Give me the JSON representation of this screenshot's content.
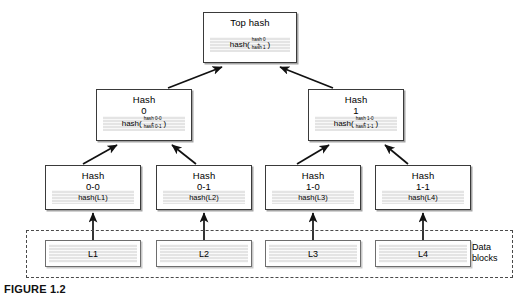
{
  "figure": {
    "caption": "FIGURE 1.2",
    "colors": {
      "box_border": "#3a3a3a",
      "formula_strip": "#e4e4e4",
      "dashed_border": "#4a4a4a",
      "background": "#ffffff",
      "text": "#000000"
    }
  },
  "tree": {
    "root": {
      "title": "Top hash",
      "subtitle": "",
      "formula_prefix": "hash(",
      "formula_arg_top": "hash 0",
      "formula_op": "+",
      "formula_arg_bottom": "hash 1",
      "formula_suffix": ")"
    },
    "mid": [
      {
        "title": "Hash",
        "subtitle": "0",
        "formula_prefix": "hash(",
        "formula_arg_top": "hash 0-0",
        "formula_op": "+",
        "formula_arg_bottom": "hash 0-1",
        "formula_suffix": ")"
      },
      {
        "title": "Hash",
        "subtitle": "1",
        "formula_prefix": "hash(",
        "formula_arg_top": "hash 1-0",
        "formula_op": "+",
        "formula_arg_bottom": "hash 1-1",
        "formula_suffix": ")"
      }
    ],
    "leaves": [
      {
        "title": "Hash",
        "subtitle": "0-0",
        "formula": "hash(L1)"
      },
      {
        "title": "Hash",
        "subtitle": "0-1",
        "formula": "hash(L2)"
      },
      {
        "title": "Hash",
        "subtitle": "1-0",
        "formula": "hash(L3)"
      },
      {
        "title": "Hash",
        "subtitle": "1-1",
        "formula": "hash(L4)"
      }
    ]
  },
  "data_blocks": {
    "group_label": "Data\nblocks",
    "group_label_line1": "Data",
    "group_label_line2": "blocks",
    "blocks": [
      {
        "label": "L1"
      },
      {
        "label": "L2"
      },
      {
        "label": "L3"
      },
      {
        "label": "L4"
      }
    ]
  }
}
